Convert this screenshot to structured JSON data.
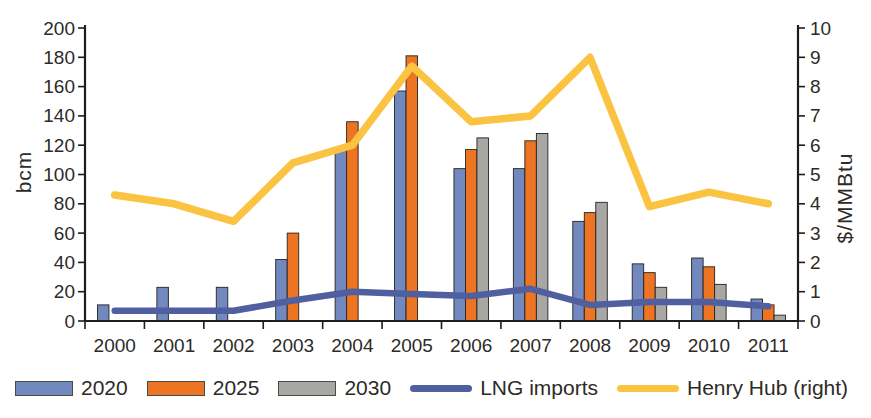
{
  "chart_data": {
    "type": "combo-bar-line",
    "title": "",
    "categories": [
      "2000",
      "2001",
      "2002",
      "2003",
      "2004",
      "2005",
      "2006",
      "2007",
      "2008",
      "2009",
      "2010",
      "2011"
    ],
    "bar_series": [
      {
        "name": "2020",
        "color": "#7289bf",
        "axis": "left",
        "values": [
          11,
          23,
          23,
          42,
          117,
          157,
          104,
          104,
          68,
          39,
          43,
          15
        ]
      },
      {
        "name": "2025",
        "color": "#ec7423",
        "axis": "left",
        "values": [
          null,
          null,
          null,
          60,
          136,
          181,
          117,
          123,
          74,
          33,
          37,
          11
        ]
      },
      {
        "name": "2030",
        "color": "#a9a7a3",
        "axis": "left",
        "values": [
          null,
          null,
          null,
          null,
          null,
          null,
          125,
          128,
          81,
          23,
          25,
          4
        ]
      }
    ],
    "line_series": [
      {
        "name": "LNG imports",
        "color": "#4f5fa0",
        "axis": "left",
        "stroke_width": 6.5,
        "values": [
          7,
          7,
          7,
          14,
          20,
          18.5,
          17,
          22,
          11,
          13,
          13,
          10
        ]
      },
      {
        "name": "Henry Hub (right)",
        "color": "#fac341",
        "axis": "right",
        "stroke_width": 7.5,
        "values": [
          4.3,
          4.0,
          3.4,
          5.4,
          6.0,
          8.7,
          6.8,
          7.0,
          9.0,
          3.9,
          4.4,
          4.0
        ]
      }
    ],
    "left_axis": {
      "label": "bcm",
      "min": 0,
      "max": 200,
      "step": 20
    },
    "right_axis": {
      "label": "$/MMBtu",
      "min": 0,
      "max": 10,
      "step": 1
    },
    "legend_position": "bottom",
    "grid": false,
    "colors": {
      "axis": "#1d1d1b",
      "text": "#2d2b28",
      "bar_outline": "#26231f",
      "background": "#ffffff"
    }
  }
}
